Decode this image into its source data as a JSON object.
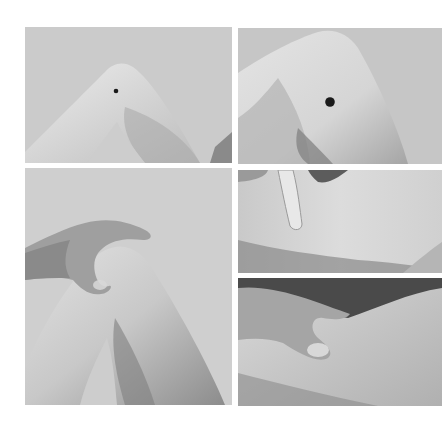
{
  "figure": {
    "panels": [
      {
        "id": "top-left",
        "content": "bent knee in profile with small black dot marked"
      },
      {
        "id": "top-right",
        "content": "close-up of bent knee with larger black dot marked"
      },
      {
        "id": "middle-left",
        "content": "hand cupping the knee from above, thumb on marked point"
      },
      {
        "id": "middle-right",
        "content": "index finger pressing on the knee region"
      },
      {
        "id": "bottom-right",
        "content": "hand grasping the knee, thumb pressing on the point"
      }
    ],
    "colors": {
      "background": "#ffffff",
      "backdrop": "#cdcdcd",
      "skin_light": "#e6e6e6",
      "skin_mid": "#b8b8b8",
      "skin_shadow": "#7a7a7a",
      "marker": "#1a1a1a"
    }
  }
}
